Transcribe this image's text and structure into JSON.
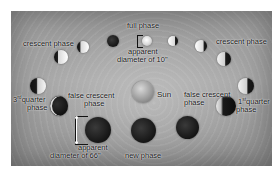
{
  "diagram": {
    "center_label": "Sun",
    "labels": {
      "full_phase": "full phase",
      "apparent_small_line1": "apparent",
      "apparent_small_line2": "diameter of 10\"",
      "crescent_left": "crescent phase",
      "crescent_right": "crescent phase",
      "third_quarter_num": "3",
      "third_quarter_sup": "rd",
      "third_quarter_word": "quarter",
      "third_quarter_line2": "phase",
      "first_quarter_num": "1",
      "first_quarter_sup": "st",
      "first_quarter_word": "quarter",
      "first_quarter_line2": "phase",
      "false_crescent_left_line1": "false crescent",
      "false_crescent_left_line2": "phase",
      "false_crescent_right_line1": "false crescent",
      "false_crescent_right_line2": "phase",
      "apparent_large_line1": "apparent",
      "apparent_large_line2": "diameter of 66\"",
      "new_phase": "new phase"
    },
    "phases": [
      {
        "id": "top-dark",
        "type": "dark"
      },
      {
        "id": "full",
        "type": "full"
      },
      {
        "id": "gibbous-right-1",
        "type": "gibbous"
      },
      {
        "id": "gibbous-right-2",
        "type": "gibbous"
      },
      {
        "id": "crescent-left-1",
        "type": "crescent"
      },
      {
        "id": "crescent-left-2",
        "type": "crescent"
      },
      {
        "id": "third-quarter",
        "type": "quarter"
      },
      {
        "id": "first-quarter",
        "type": "quarter"
      },
      {
        "id": "false-crescent-left",
        "type": "false crescent"
      },
      {
        "id": "false-crescent-right",
        "type": "false crescent"
      },
      {
        "id": "new",
        "type": "new"
      }
    ],
    "colors": {
      "background": "#ffffff",
      "panel": "#9e9e9e",
      "text": "#111111"
    }
  }
}
